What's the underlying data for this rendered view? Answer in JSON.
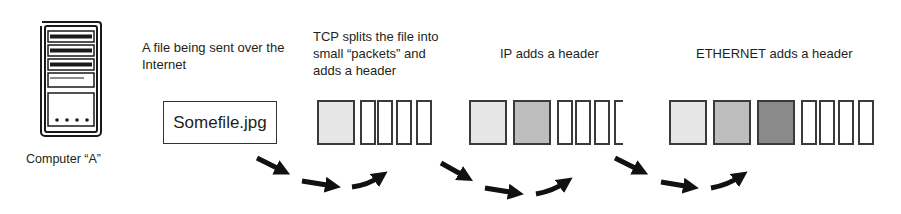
{
  "computer": {
    "icon": "computer-tower-icon",
    "label": "Computer “A”"
  },
  "stages": [
    {
      "id": "file",
      "caption": "A file being sent over the\nInternet",
      "box_label": "Somefile.jpg"
    },
    {
      "id": "tcp",
      "caption": "TCP splits the file into\nsmall “packets” and\nadds a header",
      "headers": 1,
      "packets": 4
    },
    {
      "id": "ip",
      "caption": "IP adds a header",
      "headers": 2,
      "packets": 3
    },
    {
      "id": "ethernet",
      "caption": "ETHERNET adds a header",
      "headers": 3,
      "packets": 4
    }
  ],
  "colors": {
    "tcp_header": "#e6e6e6",
    "ip_header": "#bdbdbd",
    "ethernet_header": "#8a8a8a",
    "outline": "#3a3a3a",
    "arrow": "#111111"
  },
  "arrows": [
    {
      "from": "file",
      "to": "tcp",
      "icon": "curved-arrow-icon"
    },
    {
      "from": "tcp",
      "to": "ip",
      "icon": "curved-arrow-icon"
    },
    {
      "from": "ip",
      "to": "ethernet",
      "icon": "curved-arrow-icon"
    }
  ]
}
